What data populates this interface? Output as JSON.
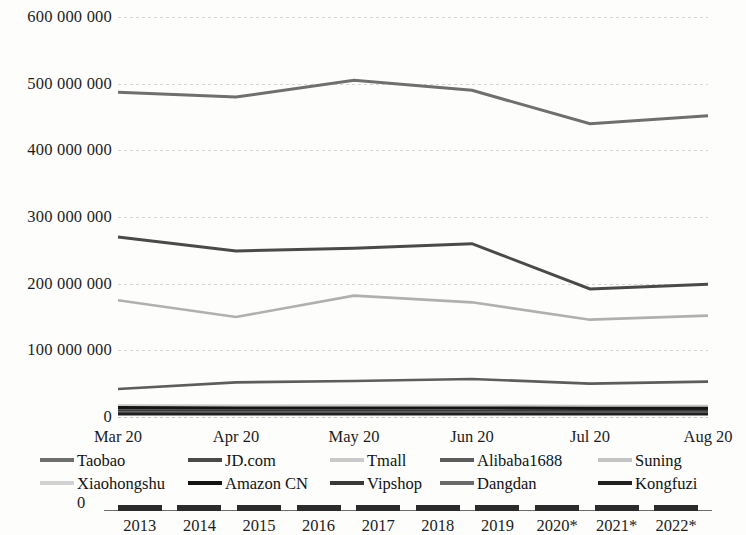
{
  "chart_data": {
    "type": "line",
    "title": "",
    "xlabel": "",
    "ylabel": "",
    "x": [
      "Mar 20",
      "Apr 20",
      "May 20",
      "Jun 20",
      "Jul 20",
      "Aug 20"
    ],
    "ylim": [
      0,
      600000000
    ],
    "yticks": [
      0,
      100000000,
      200000000,
      300000000,
      400000000,
      500000000,
      600000000
    ],
    "ytick_labels": [
      "0",
      "100 000 000",
      "200 000 000",
      "300 000 000",
      "400 000 000",
      "500 000 000",
      "600 000 000"
    ],
    "grid": true,
    "legend_position": "bottom",
    "series": [
      {
        "name": "Taobao",
        "color": "#6f6f6f",
        "width": 3.0,
        "values": [
          487000000,
          480000000,
          505000000,
          490000000,
          440000000,
          452000000
        ]
      },
      {
        "name": "JD.com",
        "color": "#4a4a4a",
        "width": 3.0,
        "values": [
          270000000,
          249000000,
          253000000,
          260000000,
          192000000,
          199000000
        ]
      },
      {
        "name": "Tmall",
        "color": "#b0b0b0",
        "width": 2.6,
        "values": [
          175000000,
          150000000,
          182000000,
          172000000,
          146000000,
          152000000
        ]
      },
      {
        "name": "Alibaba1688",
        "color": "#5d5d5d",
        "width": 2.6,
        "values": [
          42000000,
          52000000,
          54000000,
          57000000,
          50000000,
          53000000
        ]
      },
      {
        "name": "Suning",
        "color": "#c4c4c4",
        "width": 2.4,
        "values": [
          17500000,
          17000000,
          17500000,
          17000000,
          16500000,
          16500000
        ]
      },
      {
        "name": "Xiaohongshu",
        "color": "#d2d2d2",
        "width": 2.4,
        "values": [
          15500000,
          15000000,
          15500000,
          15000000,
          14500000,
          14500000
        ]
      },
      {
        "name": "Amazon CN",
        "color": "#141414",
        "width": 3.2,
        "values": [
          14000000,
          13500000,
          13500000,
          13500000,
          13000000,
          13000000
        ]
      },
      {
        "name": "Vipshop",
        "color": "#3a3a3a",
        "width": 3.0,
        "values": [
          9500000,
          9200000,
          9200000,
          9000000,
          8800000,
          8800000
        ]
      },
      {
        "name": "Dangdan",
        "color": "#6a6a6a",
        "width": 2.6,
        "values": [
          7000000,
          6800000,
          6800000,
          6600000,
          6400000,
          6400000
        ]
      },
      {
        "name": "Kongfuzi",
        "color": "#202020",
        "width": 2.8,
        "values": [
          4500000,
          4400000,
          4400000,
          4300000,
          4200000,
          4200000
        ]
      }
    ]
  },
  "legend": {
    "row1": [
      {
        "label": "Taobao",
        "color": "#6f6f6f"
      },
      {
        "label": "JD.com",
        "color": "#4a4a4a"
      },
      {
        "label": "Tmall",
        "color": "#c9c9c9"
      },
      {
        "label": "Alibaba1688",
        "color": "#5d5d5d"
      },
      {
        "label": "Suning",
        "color": "#c4c4c4"
      }
    ],
    "row2": [
      {
        "label": "Xiaohongshu",
        "color": "#d2d2d2"
      },
      {
        "label": "Amazon CN",
        "color": "#141414"
      },
      {
        "label": "Vipshop",
        "color": "#3a3a3a"
      },
      {
        "label": "Dangdan",
        "color": "#6a6a6a"
      },
      {
        "label": "Kongfuzi",
        "color": "#202020"
      }
    ]
  },
  "bottom_chart": {
    "zero_label": "0",
    "years": [
      "2013",
      "2014",
      "2015",
      "2016",
      "2017",
      "2018",
      "2019",
      "2020*",
      "2021*",
      "2022*"
    ]
  }
}
